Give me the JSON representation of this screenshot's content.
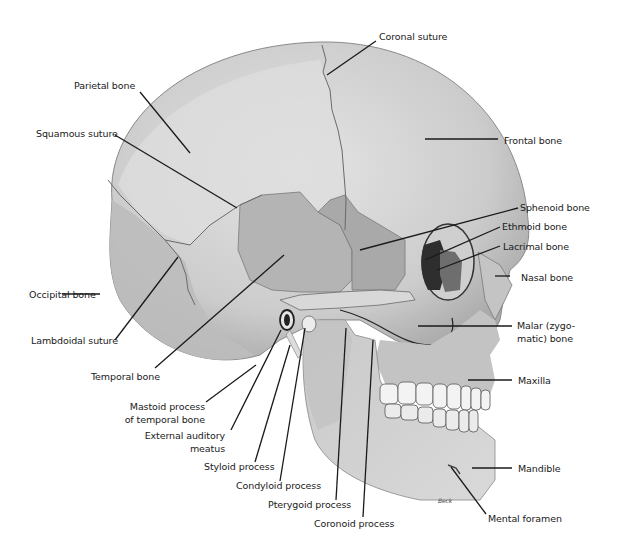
{
  "figure": {
    "signature": "Beck"
  },
  "labels": {
    "coronal_suture": "Coronal suture",
    "parietal_bone": "Parietal bone",
    "squamous_suture": "Squamous suture",
    "frontal_bone": "Frontal bone",
    "sphenoid_bone": "Sphenoid bone",
    "ethmoid_bone": "Ethmoid bone",
    "lacrimal_bone": "Lacrimal bone",
    "nasal_bone": "Nasal bone",
    "occipital_bone": "Occipital bone",
    "lambdoidal_suture": "Lambdoidal suture",
    "malar_bone_line1": "Malar (zygo-",
    "malar_bone_line2": "matic) bone",
    "temporal_bone": "Temporal bone",
    "maxilla": "Maxilla",
    "mastoid_line1": "Mastoid process",
    "mastoid_line2": "of temporal bone",
    "ext_auditory_line1": "External auditory",
    "ext_auditory_line2": "meatus",
    "styloid_process": "Styloid process",
    "condyloid_process": "Condyloid process",
    "pterygoid_process": "Pterygoid process",
    "coronoid_process": "Coronoid process",
    "mandible": "Mandible",
    "mental_foramen": "Mental foramen"
  },
  "colors": {
    "cranium_light": "#d6d6d6",
    "cranium_mid": "#c2c2c2",
    "temporal_region": "#b0b0b0",
    "sphenoid_region": "#a8a8a8",
    "orbit_dark": "#3a3a3a",
    "lacrimal": "#6e6e6e",
    "teeth": "#f2f2f2",
    "leader_line": "#1a1a1a"
  }
}
